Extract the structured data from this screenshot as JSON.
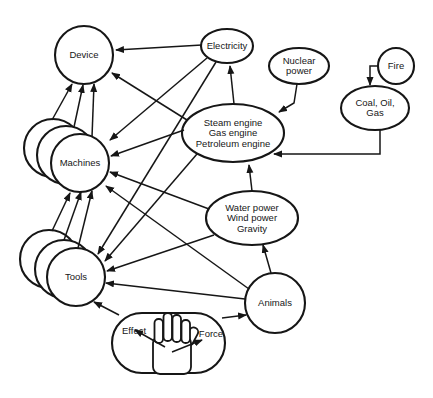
{
  "figure": {
    "background": "#ffffff",
    "ink": "#161616",
    "hand_icon": "open-hand",
    "nodes": [
      {
        "id": "device",
        "shape": "circle",
        "cx": 84,
        "cy": 55,
        "r": 29,
        "label": [
          "Device"
        ]
      },
      {
        "id": "electricity",
        "shape": "ellipse",
        "cx": 227,
        "cy": 46,
        "rx": 26,
        "ry": 17,
        "label": [
          "Electricity"
        ]
      },
      {
        "id": "nuclear-power",
        "shape": "ellipse",
        "cx": 299,
        "cy": 66,
        "rx": 30,
        "ry": 18,
        "label": [
          "Nuclear",
          "power"
        ]
      },
      {
        "id": "fire",
        "shape": "circle",
        "cx": 396,
        "cy": 66,
        "r": 18,
        "label": [
          "Fire"
        ]
      },
      {
        "id": "coal-oil-gas",
        "shape": "ellipse",
        "cx": 375,
        "cy": 108,
        "rx": 34,
        "ry": 22,
        "label": [
          "Coal, Oil,",
          "Gas"
        ]
      },
      {
        "id": "engines",
        "shape": "ellipse",
        "cx": 233,
        "cy": 133,
        "rx": 51,
        "ry": 29,
        "label": [
          "Steam engine",
          "Gas engine",
          "Petroleum engine"
        ]
      },
      {
        "id": "machines",
        "shape": "circle-stack",
        "cx": 80,
        "cy": 163,
        "r": 29,
        "stack": [
          [
            -27,
            -15
          ],
          [
            -14,
            -8
          ],
          [
            0,
            0
          ]
        ],
        "label": [
          "Machines"
        ]
      },
      {
        "id": "natural-power",
        "shape": "ellipse",
        "cx": 252,
        "cy": 218,
        "rx": 46,
        "ry": 27,
        "label": [
          "Water power",
          "Wind power",
          "Gravity"
        ]
      },
      {
        "id": "tools",
        "shape": "circle-stack",
        "cx": 76,
        "cy": 277,
        "r": 29,
        "stack": [
          [
            -27,
            -18
          ],
          [
            -12,
            -8
          ],
          [
            0,
            0
          ]
        ],
        "label": [
          "Tools"
        ]
      },
      {
        "id": "animals",
        "shape": "circle",
        "cx": 275,
        "cy": 303,
        "r": 30,
        "label": [
          "Animals"
        ]
      },
      {
        "id": "hand",
        "shape": "stadium",
        "x": 112,
        "y": 313,
        "w": 113,
        "h": 60,
        "layer": "top",
        "hand": true
      },
      {
        "id": "effect",
        "shape": "label",
        "cx": 134,
        "cy": 331,
        "layer": "top",
        "label": [
          "Effect"
        ]
      },
      {
        "id": "force",
        "shape": "label",
        "cx": 211,
        "cy": 334,
        "layer": "top",
        "label": [
          "Force"
        ]
      }
    ],
    "edges": [
      {
        "from": "electricity",
        "to": "device",
        "points": [
          [
            202,
            45
          ],
          [
            116,
            50
          ]
        ]
      },
      {
        "from": "engines",
        "to": "device",
        "points": [
          [
            187,
            120
          ],
          [
            112,
            73
          ]
        ]
      },
      {
        "from": "machines",
        "to": "device",
        "points": [
          [
            52,
            120
          ],
          [
            72,
            84
          ]
        ]
      },
      {
        "from": "machines",
        "to": "device",
        "points": [
          [
            74,
            127
          ],
          [
            83,
            85
          ]
        ]
      },
      {
        "from": "machines",
        "to": "device",
        "points": [
          [
            92,
            137
          ],
          [
            94,
            84
          ]
        ]
      },
      {
        "from": "tools",
        "to": "machines",
        "points": [
          [
            52,
            231
          ],
          [
            70,
            193
          ]
        ]
      },
      {
        "from": "tools",
        "to": "machines",
        "points": [
          [
            64,
            240
          ],
          [
            81,
            192
          ]
        ]
      },
      {
        "from": "tools",
        "to": "machines",
        "points": [
          [
            78,
            248
          ],
          [
            92,
            191
          ]
        ]
      },
      {
        "from": "electricity",
        "to": "machines",
        "points": [
          [
            207,
            58
          ],
          [
            110,
            140
          ]
        ]
      },
      {
        "from": "electricity",
        "to": "tools",
        "points": [
          [
            216,
            62
          ],
          [
            98,
            254
          ]
        ]
      },
      {
        "from": "engines",
        "to": "machines",
        "points": [
          [
            184,
            130
          ],
          [
            111,
            156
          ]
        ]
      },
      {
        "from": "engines",
        "to": "tools",
        "points": [
          [
            197,
            154
          ],
          [
            105,
            261
          ]
        ]
      },
      {
        "from": "natural-power",
        "to": "machines",
        "points": [
          [
            209,
            209
          ],
          [
            110,
            172
          ]
        ]
      },
      {
        "from": "natural-power",
        "to": "tools",
        "points": [
          [
            214,
            235
          ],
          [
            107,
            271
          ]
        ]
      },
      {
        "from": "animals",
        "to": "machines",
        "points": [
          [
            249,
            289
          ],
          [
            106,
            186
          ]
        ]
      },
      {
        "from": "animals",
        "to": "tools",
        "points": [
          [
            245,
            299
          ],
          [
            106,
            283
          ]
        ]
      },
      {
        "from": "animals",
        "to": "natural-power",
        "points": [
          [
            271,
            273
          ],
          [
            263,
            245
          ]
        ]
      },
      {
        "from": "natural-power",
        "to": "engines",
        "points": [
          [
            252,
            191
          ],
          [
            249,
            165
          ]
        ]
      },
      {
        "from": "engines",
        "to": "electricity",
        "points": [
          [
            234,
            104
          ],
          [
            230,
            66
          ]
        ]
      },
      {
        "from": "nuclear-power",
        "to": "engines",
        "points": [
          [
            297,
            84
          ],
          [
            294,
            103
          ],
          [
            279,
            112
          ]
        ]
      },
      {
        "from": "fire",
        "to": "coal-oil-gas",
        "points": [
          [
            378,
            66
          ],
          [
            370,
            66
          ],
          [
            370,
            85
          ]
        ]
      },
      {
        "from": "coal-oil-gas",
        "to": "engines",
        "points": [
          [
            380,
            129
          ],
          [
            380,
            154
          ],
          [
            274,
            154
          ]
        ]
      },
      {
        "from": "hand",
        "to": "tools",
        "points": [
          [
            119,
            315
          ],
          [
            94,
            302
          ]
        ]
      },
      {
        "from": "hand",
        "to": "animals",
        "points": [
          [
            222,
            318
          ],
          [
            246,
            315
          ]
        ]
      },
      {
        "from": "hand",
        "to": "effect",
        "points": [
          [
            165,
            347
          ],
          [
            135,
            330
          ]
        ],
        "layer": "overlay"
      },
      {
        "from": "hand",
        "to": "force",
        "points": [
          [
            172,
            352
          ],
          [
            202,
            340
          ]
        ],
        "layer": "overlay"
      }
    ]
  }
}
